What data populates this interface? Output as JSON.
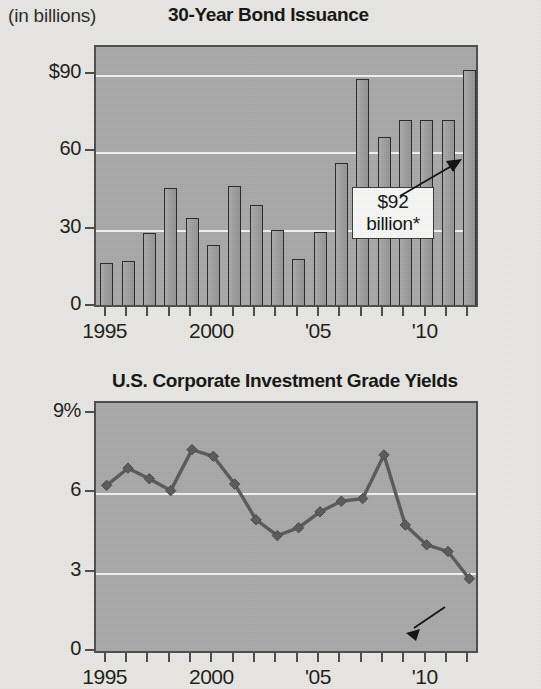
{
  "bars_panel": {
    "units_label": "(in billions)",
    "title": "30-Year Bond Issuance",
    "callout_line1": "$92",
    "callout_line2": "billion*"
  },
  "line_panel": {
    "title": "U.S. Corporate Investment Grade Yields",
    "callout_value": "2.77%",
    "callout_dagger": "†"
  },
  "chart_data": [
    {
      "type": "bar",
      "title": "30-Year Bond Issuance",
      "subtitle": "(in billions)",
      "xlabel": "",
      "ylabel": "(in billions)",
      "ylim": [
        0,
        100
      ],
      "yticks": [
        0,
        30,
        60,
        90
      ],
      "ytick_labels": [
        "0",
        "30",
        "60",
        "$90"
      ],
      "grid": true,
      "gridlines_at": [
        30,
        60,
        90
      ],
      "xlim": [
        1994.4,
        2012.6
      ],
      "xticks": [
        1995,
        1996,
        1997,
        1998,
        1999,
        2000,
        2001,
        2002,
        2003,
        2004,
        2005,
        2006,
        2007,
        2008,
        2009,
        2010,
        2011,
        2012
      ],
      "xtick_labels_shown": [
        {
          "x": 1995,
          "label": "1995"
        },
        {
          "x": 2000,
          "label": "2000"
        },
        {
          "x": 2005,
          "label": "'05"
        },
        {
          "x": 2010,
          "label": "'10"
        }
      ],
      "categories": [
        "1995",
        "1996",
        "1997",
        "1998",
        "1999",
        "2000",
        "2001",
        "2002",
        "2003",
        "2004",
        "2005",
        "2006",
        "2007",
        "2008",
        "2009",
        "2010",
        "2011",
        "2012"
      ],
      "values": [
        17,
        18,
        28.5,
        46,
        34.5,
        24,
        47,
        39.5,
        30,
        18.5,
        29,
        56,
        88.5,
        66,
        72.5,
        72.5,
        72.5,
        92
      ],
      "annotations": [
        {
          "text": "$92 billion*",
          "points_to_category": "2012",
          "points_to_value": 92
        }
      ]
    },
    {
      "type": "line",
      "title": "U.S. Corporate Investment Grade Yields",
      "xlabel": "",
      "ylabel": "",
      "ylim": [
        0,
        9
      ],
      "yticks": [
        0,
        3,
        6,
        9
      ],
      "ytick_labels": [
        "0",
        "3",
        "6",
        "9%"
      ],
      "grid": true,
      "gridlines_at": [
        3,
        6
      ],
      "xlim": [
        1994.4,
        2012.6
      ],
      "xticks": [
        1995,
        1996,
        1997,
        1998,
        1999,
        2000,
        2001,
        2002,
        2003,
        2004,
        2005,
        2006,
        2007,
        2008,
        2009,
        2010,
        2011,
        2012
      ],
      "xtick_labels_shown": [
        {
          "x": 1995,
          "label": "1995"
        },
        {
          "x": 2000,
          "label": "2000"
        },
        {
          "x": 2005,
          "label": "'05"
        },
        {
          "x": 2010,
          "label": "'10"
        }
      ],
      "x": [
        "1995",
        "1996",
        "1997",
        "1998",
        "1999",
        "2000",
        "2001",
        "2002",
        "2003",
        "2004",
        "2005",
        "2006",
        "2007",
        "2008",
        "2009",
        "2010",
        "2011",
        "2012"
      ],
      "values": [
        6.3,
        6.95,
        6.55,
        6.1,
        7.65,
        7.4,
        6.35,
        5.0,
        4.4,
        4.7,
        5.3,
        5.7,
        5.8,
        7.45,
        4.8,
        4.05,
        3.8,
        2.77
      ],
      "marker": "diamond",
      "line_color": "#5a5a5a",
      "annotations": [
        {
          "text": "2.77%†",
          "points_to_x": "2012",
          "points_to_value": 2.77
        }
      ]
    }
  ],
  "colors": {
    "page_background": "#e8e7e3",
    "plot_background": "#a9a9a9",
    "bar_fill": "#9a9a9a",
    "bar_stroke": "#2a2a2a",
    "gridline": "#f2f2f0",
    "axis": "#4c4c4c",
    "text": "#1a1a1a",
    "callout_background": "#f7f7f5"
  }
}
